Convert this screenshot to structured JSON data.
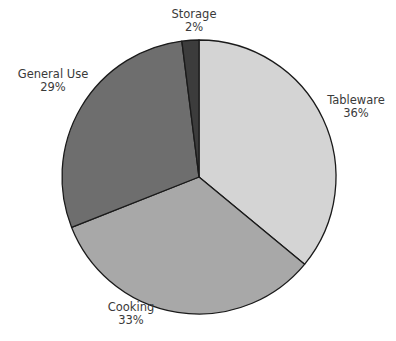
{
  "chart_data": {
    "type": "pie",
    "title": "",
    "categories": [
      "Tableware",
      "Cooking",
      "General Use",
      "Storage"
    ],
    "values": [
      36,
      33,
      29,
      2
    ],
    "value_labels": [
      "36%",
      "33%",
      "29%",
      "2%"
    ],
    "colors": [
      "#d4d4d4",
      "#a8a8a8",
      "#6e6e6e",
      "#3c3c3c"
    ],
    "start_angle_deg": 0,
    "direction": "clockwise",
    "legend": "none",
    "labels_outside": true
  },
  "geometry": {
    "cx": 199,
    "cy": 177,
    "r": 137
  },
  "labels": [
    {
      "name": "Tableware",
      "pct": "36%",
      "x": 356,
      "y": 94
    },
    {
      "name": "Cooking",
      "pct": "33%",
      "x": 131,
      "y": 301
    },
    {
      "name": "General Use",
      "pct": "29%",
      "x": 53,
      "y": 68
    },
    {
      "name": "Storage",
      "pct": "2%",
      "x": 194,
      "y": 8
    }
  ]
}
